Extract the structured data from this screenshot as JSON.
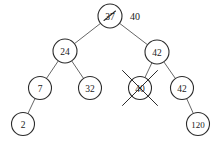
{
  "diagram": {
    "type": "binary-search-tree",
    "canvas": {
      "width": 220,
      "height": 144,
      "background": "#ffffff"
    },
    "style": {
      "node_stroke": "#2b2b2b",
      "node_fill": "#ffffff",
      "edge_stroke": "#555555",
      "text_color": "#1a1a1a",
      "mark_color": "#2b2b2b"
    },
    "nodes": [
      {
        "id": "root",
        "label": "37",
        "cx": 110,
        "cy": 16,
        "r": 12,
        "font_size": 9.5,
        "mark": "strikethrough",
        "name": "node-37-root"
      },
      {
        "id": "n24",
        "label": "24",
        "cx": 65,
        "cy": 51,
        "r": 12,
        "font_size": 9.5,
        "mark": "none",
        "name": "node-24"
      },
      {
        "id": "n42a",
        "label": "42",
        "cx": 157,
        "cy": 52,
        "r": 12,
        "font_size": 9.5,
        "mark": "none",
        "name": "node-42-right"
      },
      {
        "id": "n7",
        "label": "7",
        "cx": 40,
        "cy": 88,
        "r": 11.5,
        "font_size": 9.5,
        "mark": "none",
        "name": "node-7"
      },
      {
        "id": "n32",
        "label": "32",
        "cx": 90,
        "cy": 88,
        "r": 11.5,
        "font_size": 9.5,
        "mark": "none",
        "name": "node-32"
      },
      {
        "id": "n40",
        "label": "40",
        "cx": 140,
        "cy": 88,
        "r": 11.5,
        "font_size": 9.5,
        "mark": "cross-out",
        "name": "node-40-deleted"
      },
      {
        "id": "n42b",
        "label": "42",
        "cx": 182,
        "cy": 88,
        "r": 11.5,
        "font_size": 9.5,
        "mark": "none",
        "name": "node-42-leaf-parent"
      },
      {
        "id": "n2",
        "label": "2",
        "cx": 23,
        "cy": 124,
        "r": 11.5,
        "font_size": 9.5,
        "mark": "none",
        "name": "node-2"
      },
      {
        "id": "n120",
        "label": "120",
        "cx": 198,
        "cy": 124,
        "r": 11.5,
        "font_size": 9,
        "mark": "none",
        "name": "node-120"
      }
    ],
    "edges": [
      {
        "from": "root",
        "to": "n24",
        "name": "edge-37-24"
      },
      {
        "from": "root",
        "to": "n42a",
        "name": "edge-37-42"
      },
      {
        "from": "n24",
        "to": "n7",
        "name": "edge-24-7"
      },
      {
        "from": "n24",
        "to": "n32",
        "name": "edge-24-32"
      },
      {
        "from": "n42a",
        "to": "n40",
        "name": "edge-42-40"
      },
      {
        "from": "n42a",
        "to": "n42b",
        "name": "edge-42-42"
      },
      {
        "from": "n7",
        "to": "n2",
        "name": "edge-7-2"
      },
      {
        "from": "n42b",
        "to": "n120",
        "name": "edge-42-120"
      }
    ],
    "annotations": [
      {
        "id": "replacement",
        "text": "40",
        "x": 130,
        "y": 16,
        "font_size": 10,
        "name": "annotation-replacement-value-40"
      }
    ]
  }
}
